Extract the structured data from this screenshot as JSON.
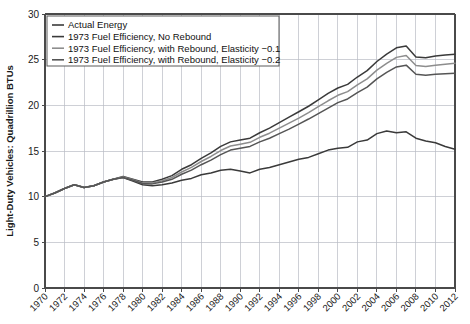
{
  "chart_data": {
    "type": "line",
    "title": "",
    "xlabel": "",
    "ylabel": "Light-Duty Vehicles: Quadrillion BTUs",
    "xlim": [
      1970,
      2012
    ],
    "ylim": [
      0,
      30
    ],
    "ytick_step": 5,
    "xtick_step": 2,
    "grid": true,
    "legend_position": "top-left",
    "x": [
      1970,
      1971,
      1972,
      1973,
      1974,
      1975,
      1976,
      1977,
      1978,
      1979,
      1980,
      1981,
      1982,
      1983,
      1984,
      1985,
      1986,
      1987,
      1988,
      1989,
      1990,
      1991,
      1992,
      1993,
      1994,
      1995,
      1996,
      1997,
      1998,
      1999,
      2000,
      2001,
      2002,
      2003,
      2004,
      2005,
      2006,
      2007,
      2008,
      2009,
      2010,
      2011,
      2012
    ],
    "ytick_labels": [
      "0",
      "5",
      "10",
      "15",
      "20",
      "25",
      "30"
    ],
    "xtick_labels": [
      "1970",
      "1972",
      "1974",
      "1976",
      "1978",
      "1980",
      "1982",
      "1984",
      "1986",
      "1988",
      "1990",
      "1992",
      "1994",
      "1996",
      "1998",
      "2000",
      "2002",
      "2004",
      "2006",
      "2008",
      "2010",
      "2012"
    ],
    "series": [
      {
        "name": "Actual Energy",
        "color": "#3a3a3a",
        "width": 1.5,
        "values": [
          10.0,
          10.4,
          10.9,
          11.3,
          11.0,
          11.2,
          11.6,
          11.9,
          12.1,
          11.7,
          11.3,
          11.2,
          11.3,
          11.5,
          11.8,
          12.0,
          12.4,
          12.6,
          12.9,
          13.0,
          12.8,
          12.6,
          13.0,
          13.2,
          13.5,
          13.8,
          14.1,
          14.3,
          14.7,
          15.1,
          15.3,
          15.4,
          16.0,
          16.2,
          16.9,
          17.2,
          17.0,
          17.1,
          16.4,
          16.1,
          15.9,
          15.5,
          15.2
        ]
      },
      {
        "name": "1973 Fuel Efficiency, No Rebound",
        "color": "#3a3a3a",
        "width": 1.5,
        "values": [
          10.0,
          10.4,
          10.9,
          11.3,
          11.0,
          11.2,
          11.6,
          11.9,
          12.2,
          11.9,
          11.6,
          11.6,
          11.9,
          12.3,
          13.0,
          13.5,
          14.2,
          14.8,
          15.5,
          16.0,
          16.2,
          16.4,
          17.0,
          17.5,
          18.1,
          18.7,
          19.3,
          19.9,
          20.6,
          21.3,
          21.9,
          22.3,
          23.1,
          23.8,
          24.8,
          25.6,
          26.3,
          26.5,
          25.3,
          25.2,
          25.4,
          25.5,
          25.6
        ]
      },
      {
        "name": "1973 Fuel Efficiency, with Rebound, Elasticity −0.1",
        "color": "#8d8d8d",
        "width": 1.5,
        "values": [
          10.0,
          10.4,
          10.9,
          11.3,
          11.0,
          11.2,
          11.6,
          11.9,
          12.15,
          11.85,
          11.5,
          11.5,
          11.75,
          12.1,
          12.7,
          13.2,
          13.85,
          14.4,
          15.05,
          15.55,
          15.75,
          15.95,
          16.5,
          16.95,
          17.5,
          18.05,
          18.6,
          19.2,
          19.85,
          20.5,
          21.1,
          21.5,
          22.25,
          22.9,
          23.85,
          24.6,
          25.25,
          25.45,
          24.35,
          24.25,
          24.4,
          24.5,
          24.6
        ]
      },
      {
        "name": "1973 Fuel Efficiency, with Rebound, Elasticity −0.2",
        "color": "#555555",
        "width": 1.5,
        "values": [
          10.0,
          10.4,
          10.9,
          11.3,
          11.0,
          11.2,
          11.6,
          11.9,
          12.1,
          11.8,
          11.45,
          11.4,
          11.6,
          11.9,
          12.45,
          12.9,
          13.5,
          14.0,
          14.6,
          15.1,
          15.3,
          15.5,
          16.0,
          16.4,
          16.9,
          17.4,
          17.95,
          18.5,
          19.1,
          19.7,
          20.3,
          20.7,
          21.4,
          22.0,
          22.9,
          23.6,
          24.2,
          24.4,
          23.4,
          23.3,
          23.4,
          23.45,
          23.5
        ]
      }
    ]
  },
  "legend": {
    "entries": [
      "Actual Energy",
      "1973 Fuel Efficiency, No Rebound",
      "1973 Fuel Efficiency, with Rebound, Elasticity −0.1",
      "1973 Fuel Efficiency, with Rebound, Elasticity −0.2"
    ]
  }
}
